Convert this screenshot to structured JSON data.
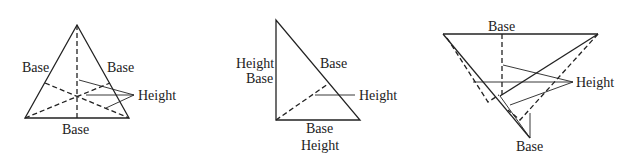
{
  "figures": [
    {
      "name": "equilateral-triangle",
      "labels": {
        "left": "Base",
        "right": "Base",
        "bottom": "Base",
        "height": "Height"
      }
    },
    {
      "name": "right-triangle",
      "labels": {
        "left_height": "Height",
        "left_base": "Base",
        "hyp": "Base",
        "height": "Height",
        "bottom_base": "Base",
        "bottom_height": "Height"
      }
    },
    {
      "name": "obtuse-triangle",
      "labels": {
        "top": "Base",
        "height": "Height",
        "bottom": "Base"
      }
    }
  ]
}
